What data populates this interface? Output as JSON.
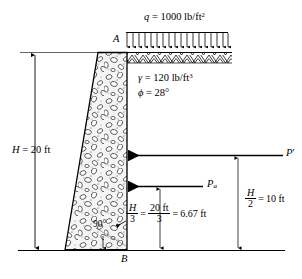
{
  "figure": {
    "surcharge": {
      "symbol": "q",
      "equals": "=",
      "value": "1000",
      "unit": "lb/ft",
      "unit_exp": "2",
      "full_label": "q = 1000 lb/ft2",
      "arrow_count": 18
    },
    "soil": {
      "unit_weight_symbol": "γ",
      "unit_weight_equals": "=",
      "unit_weight_value": "120",
      "unit_weight_unit": "lb/ft",
      "unit_weight_exp": "3",
      "friction_symbol": "ϕ",
      "friction_equals": "=",
      "friction_value": "28°",
      "unit_weight_full": "γ = 120 lb/ft3",
      "friction_full": "ϕ = 28°"
    },
    "points": {
      "top_point": "A",
      "bottom_point": "B"
    },
    "height": {
      "symbol": "H",
      "equals": "=",
      "value": "20 ft",
      "full_label": "H = 20 ft"
    },
    "forces": {
      "resultant_label": "P",
      "resultant_prime": "′",
      "active_label": "P",
      "active_sub": "a"
    },
    "dim_third": {
      "num": "H",
      "den": "3",
      "eq1": "=",
      "num2": "20 ft",
      "den2": "3",
      "eq2": "=",
      "result": "6.67 ft",
      "full_label": "H/3 = 20 ft/3 = 6.67 ft"
    },
    "dim_half": {
      "num": "H",
      "den": "2",
      "eq": "=",
      "result": "10 ft",
      "full_label": "H/2 = 10 ft"
    },
    "angle": {
      "label": "90°"
    },
    "colors": {
      "line": "#000000",
      "background": "#ffffff",
      "fill_stone": "#f2f2f2",
      "ground_line": "#555555"
    }
  }
}
